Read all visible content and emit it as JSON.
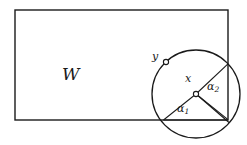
{
  "figure": {
    "type": "geometric-diagram",
    "background_color": "#ffffff",
    "stroke_color": "#1a1a1a",
    "labels": {
      "region": "W",
      "center_point": "x",
      "boundary_point": "y",
      "angle_one": "α",
      "angle_one_sub": "1",
      "angle_two": "α",
      "angle_two_sub": "2"
    },
    "geometry": {
      "rectangle": {
        "left": 15,
        "top": 10,
        "right": 228,
        "bottom": 120,
        "stroke_width": 1.4
      },
      "circle": {
        "cx": 196,
        "cy": 94,
        "r": 44,
        "stroke_width": 1.4
      },
      "center_marker": {
        "cx": 196,
        "cy": 94,
        "r": 2.6
      },
      "point_y_marker": {
        "cx": 166,
        "cy": 62,
        "r": 2.6
      },
      "radii": [
        {
          "name": "radius-to-lower-left-intersection",
          "x1": 196,
          "y1": 94,
          "x2": 163.5,
          "y2": 120
        },
        {
          "name": "radius-to-corner",
          "x1": 196,
          "y1": 94,
          "x2": 228,
          "y2": 120
        },
        {
          "name": "radius-to-corner-lower",
          "x1": 196,
          "y1": 94,
          "x2": 228.5,
          "y2": 122
        },
        {
          "name": "radius-to-upper-right-intersection",
          "x1": 196,
          "y1": 94,
          "x2": 228,
          "y2": 64
        }
      ],
      "chords": [
        {
          "name": "chord-bottom-edge",
          "x1": 163.5,
          "y1": 120,
          "x2": 228,
          "y2": 120
        }
      ]
    },
    "label_positions": {
      "region": {
        "left": 62,
        "top": 66
      },
      "center_point": {
        "left": 185,
        "top": 73
      },
      "boundary_point": {
        "left": 152,
        "top": 51
      },
      "angle_one": {
        "left": 177,
        "top": 103
      },
      "angle_two": {
        "left": 207,
        "top": 81
      }
    }
  }
}
